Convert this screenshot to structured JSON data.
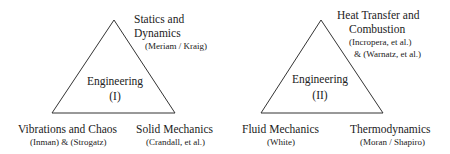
{
  "diagrams": [
    {
      "center_label": "Engineering",
      "center_sub": "(I)",
      "top": {
        "title_line1": "Statics and",
        "title_line2": "Dynamics",
        "refs": "(Meriam / Kraig)"
      },
      "bottom_left": {
        "title": "Vibrations and Chaos",
        "refs": "(Inman) & (Strogatz)"
      },
      "bottom_right": {
        "title": "Solid Mechanics",
        "refs": "(Crandall, et al.)"
      }
    },
    {
      "center_label": "Engineering",
      "center_sub": "(II)",
      "top": {
        "title_line1": "Heat Transfer and",
        "title_line2": "Combustion",
        "refs_line1": "(Incropera, et al.)",
        "refs_line2": "& (Warnatz, et al.)"
      },
      "bottom_left": {
        "title": "Fluid Mechanics",
        "refs": "(White)"
      },
      "bottom_right": {
        "title": "Thermodynamics",
        "refs": "(Moran / Shapiro)"
      }
    }
  ]
}
